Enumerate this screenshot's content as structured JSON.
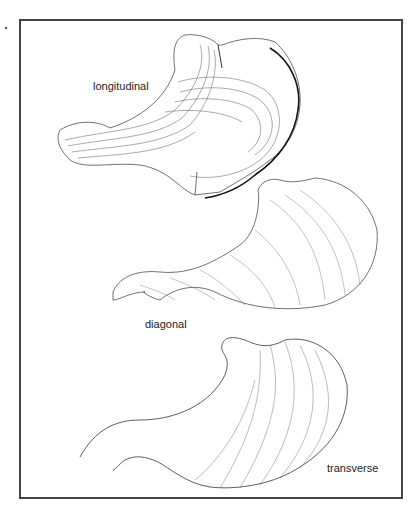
{
  "figure": {
    "labels": {
      "longitudinal": "longitudinal",
      "diagonal": "diagonal",
      "transverse": "transverse"
    },
    "panels": [
      {
        "name": "longitudinal",
        "description": "stomach with longitudinal muscle layer"
      },
      {
        "name": "diagonal",
        "description": "stomach with diagonal (oblique) muscle layer"
      },
      {
        "name": "transverse",
        "description": "stomach with transverse (circular) muscle layer"
      }
    ],
    "colors": {
      "ink": "#222222",
      "frame": "#444444",
      "background": "#ffffff"
    }
  }
}
